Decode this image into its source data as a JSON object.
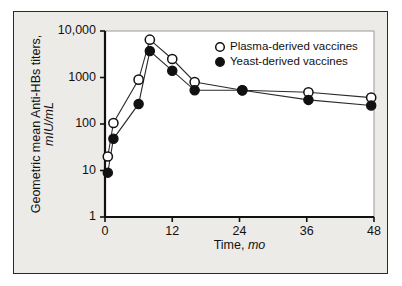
{
  "chart_data": {
    "type": "line",
    "title": "",
    "xlabel": "Time, mo",
    "xlabel_roman": "Time,",
    "xlabel_italic": "mo",
    "ylabel": "Geometric mean Anti-HBs titers, mIU/mL",
    "ylabel_roman": "Geometric mean Anti-HBs titers,",
    "ylabel_italic": "mIU/mL",
    "yscale": "log",
    "xlim": [
      0,
      48
    ],
    "ylim": [
      1,
      10000
    ],
    "xticks": [
      0,
      12,
      24,
      36,
      48
    ],
    "xticklabels": [
      "0",
      "12",
      "24",
      "36",
      "48"
    ],
    "yticks": [
      1,
      10,
      100,
      1000,
      10000
    ],
    "yticklabels": [
      "1",
      "10",
      "100",
      "1000",
      "10,000"
    ],
    "grid": false,
    "legend_position": "top-right",
    "series": [
      {
        "name": "Plasma-derived vaccines",
        "marker": "open-circle",
        "color": "#ffffff",
        "edge_color": "#111111",
        "x": [
          0.5,
          1.5,
          6,
          8,
          12,
          16,
          24.5,
          36.3,
          47.5
        ],
        "values": [
          20,
          105,
          900,
          6500,
          2500,
          800,
          530,
          480,
          370
        ]
      },
      {
        "name": "Yeast-derived vaccines",
        "marker": "filled-circle",
        "color": "#111111",
        "edge_color": "#111111",
        "x": [
          0.5,
          1.5,
          6,
          8,
          12,
          16,
          24.5,
          36.3,
          47.5
        ],
        "values": [
          9,
          48,
          270,
          3700,
          1400,
          530,
          530,
          330,
          250
        ]
      }
    ],
    "legend": [
      {
        "label": "Plasma-derived vaccines",
        "marker": "open-circle"
      },
      {
        "label": "Yeast-derived vaccines",
        "marker": "filled-circle"
      }
    ]
  },
  "figure": {
    "background": "#ecebe8",
    "plot_background": "#ffffff",
    "border_color": "#2a2a2a"
  }
}
